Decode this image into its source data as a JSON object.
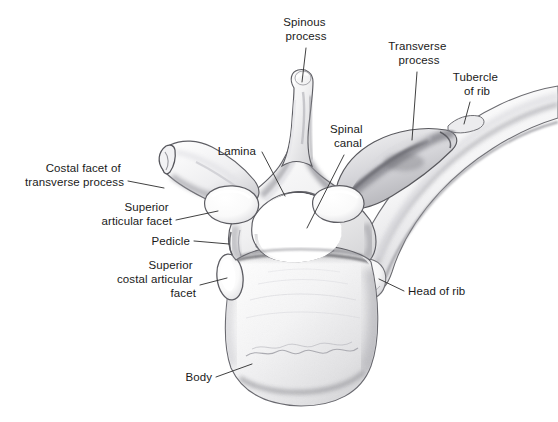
{
  "figure": {
    "width": 558,
    "height": 422,
    "background_color": "#ffffff",
    "ink_color": "#2b2b2b",
    "text_color": "#1a1a1a",
    "style": "graphite pencil anatomical drawing, grayscale"
  },
  "labels": [
    {
      "id": "spinous-process",
      "lines": [
        "Spinous",
        "process"
      ],
      "text_anchor": "middle",
      "x": 306,
      "y": 26,
      "leader": "M 306 48 L 302 82"
    },
    {
      "id": "transverse-process",
      "lines": [
        "Transverse",
        "process"
      ],
      "text_anchor": "middle",
      "x": 419,
      "y": 50,
      "leader": "M 417 72 L 412 140"
    },
    {
      "id": "tubercle-of-rib",
      "lines": [
        "Tubercle",
        "of rib"
      ],
      "text_anchor": "middle",
      "x": 477,
      "y": 81,
      "leader": "M 470 102 L 464 122"
    },
    {
      "id": "lamina",
      "lines": [
        "Lamina"
      ],
      "text_anchor": "end",
      "x": 256,
      "y": 151,
      "leader": "M 260 151 L 283 194"
    },
    {
      "id": "spinal-canal",
      "lines": [
        "Spinal",
        "canal"
      ],
      "text_anchor": "middle",
      "x": 348,
      "y": 133,
      "leader": "M 344 155 L 307 228"
    },
    {
      "id": "costal-facet-of-transverse-process",
      "lines": [
        "Costal facet of",
        "transverse process"
      ],
      "text_anchor": "end",
      "x": 124,
      "y": 172,
      "leader": "M 128 181 L 160 189"
    },
    {
      "id": "superior-articular-facet",
      "lines": [
        "Superior",
        "articular facet"
      ],
      "text_anchor": "end",
      "x": 172,
      "y": 211,
      "leader": "M 176 219 L 216 211"
    },
    {
      "id": "pedicle",
      "lines": [
        "Pedicle"
      ],
      "text_anchor": "end",
      "x": 190,
      "y": 245,
      "leader": "M 194 241 L 228 244"
    },
    {
      "id": "superior-costal-articular-facet",
      "lines": [
        "Superior",
        "costal articular",
        "facet"
      ],
      "text_anchor": "end",
      "x": 196,
      "y": 269,
      "leader": "M 200 284 L 226 277"
    },
    {
      "id": "head-of-rib",
      "lines": [
        "Head of rib"
      ],
      "text_anchor": "start",
      "x": 408,
      "y": 295,
      "leader": "M 404 291 L 381 279"
    },
    {
      "id": "body",
      "lines": [
        "Body"
      ],
      "text_anchor": "end",
      "x": 212,
      "y": 381,
      "leader": "M 216 377 L 250 365"
    }
  ],
  "anatomy_parts": [
    "spinous process",
    "lamina",
    "spinal canal",
    "transverse process",
    "costal facet of transverse process",
    "superior articular facet",
    "pedicle",
    "superior costal articular facet",
    "body",
    "head of rib",
    "tubercle of rib",
    "rib shaft"
  ]
}
